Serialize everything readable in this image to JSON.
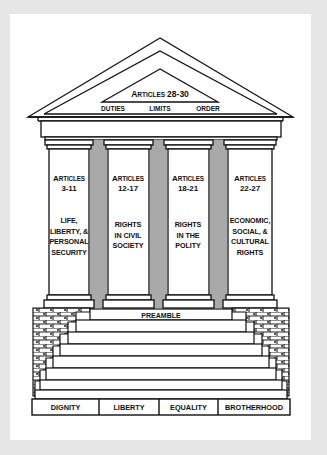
{
  "diagram": {
    "title_type": "Temple of human rights",
    "colors": {
      "background": "#e6e6e6",
      "panel": "#ffffff",
      "stroke": "#111111",
      "column_gap": "#a9a9a9"
    },
    "pediment": {
      "heading_cap": "A",
      "heading_rest": "RTICLES",
      "heading_range": "28-30",
      "labels": [
        "DUTIES",
        "LIMITS",
        "ORDER"
      ]
    },
    "columns": [
      {
        "heading_cap": "A",
        "heading_rest": "RTICLES",
        "range": "3-11",
        "lines": [
          "LIFE,",
          "LIBERTY, &",
          "PERSONAL",
          "SECURITY"
        ]
      },
      {
        "heading_cap": "A",
        "heading_rest": "RTICLES",
        "range": "12-17",
        "lines": [
          "RIGHTS",
          "IN CIVIL",
          "SOCIETY"
        ]
      },
      {
        "heading_cap": "A",
        "heading_rest": "RTICLES",
        "range": "18-21",
        "lines": [
          "RIGHTS",
          "IN THE",
          "POLITY"
        ]
      },
      {
        "heading_cap": "A",
        "heading_rest": "RTICLES",
        "range": "22-27",
        "lines": [
          "ECONOMIC,",
          "SOCIAL, &",
          "CULTURAL",
          "RIGHTS"
        ]
      }
    ],
    "steps": {
      "top_step_label": "PREAMBLE"
    },
    "foundation": [
      "DIGNITY",
      "LIBERTY",
      "EQUALITY",
      "BROTHERHOOD"
    ]
  }
}
